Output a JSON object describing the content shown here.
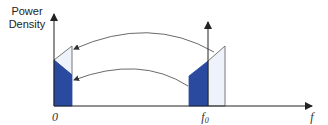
{
  "diagram": {
    "y_axis_label_line1": "Power",
    "y_axis_label_line2": "Density",
    "x_axis_label": "f",
    "origin_label": "0",
    "carrier_label": "f",
    "carrier_subscript": "0",
    "colors": {
      "dark_band": "#2a4aa0",
      "light_band": "#eef3fb",
      "stroke": "#555555",
      "axis": "#333333"
    }
  }
}
